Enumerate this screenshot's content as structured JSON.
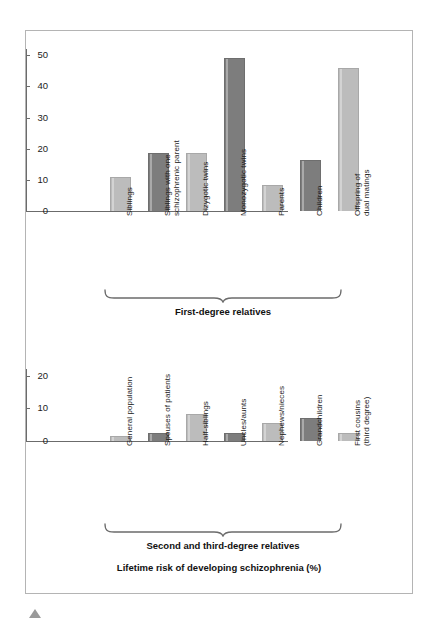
{
  "figure": {
    "caption": "Lifetime risk of developing schizophrenia (%)",
    "marker_icon": "triangle-up-icon"
  },
  "chart_data": [
    {
      "id": "first-degree",
      "type": "bar",
      "title": "",
      "group_label": "First-degree relatives",
      "xlabel": "",
      "ylabel": "",
      "ylim": [
        0,
        52
      ],
      "yticks": [
        0,
        10,
        20,
        30,
        40,
        50
      ],
      "ytick_labels": [
        "0",
        "10",
        "20",
        "30",
        "40",
        "50"
      ],
      "grid": false,
      "legend": "none",
      "categories": [
        "Siblings",
        "Siblings with one\nschizophrenic parent",
        "Dizygotic twins",
        "Monozygotic twins",
        "Parents",
        "Children",
        "Offspring of\ndual matings"
      ],
      "values": [
        11,
        18.5,
        18.7,
        49,
        8.4,
        16.5,
        46
      ],
      "bar_shades": [
        "light",
        "dark",
        "light",
        "dark",
        "light",
        "dark",
        "light"
      ]
    },
    {
      "id": "second-third-degree",
      "type": "bar",
      "title": "",
      "group_label": "Second and third-degree relatives",
      "xlabel": "",
      "ylabel": "",
      "ylim": [
        0,
        22
      ],
      "yticks": [
        0,
        10,
        20
      ],
      "ytick_labels": [
        "0",
        "10",
        "20"
      ],
      "grid": false,
      "legend": "none",
      "categories": [
        "General population",
        "Spouses of patients",
        "Half-siblings",
        "Uncles/aunts",
        "Nephews/nieces",
        "Grandchildren",
        "First cousins\n(third degree)"
      ],
      "values": [
        1.6,
        2.5,
        8.2,
        2.4,
        5.6,
        7.0,
        2.4
      ],
      "bar_shades": [
        "light",
        "dark",
        "light",
        "dark",
        "light",
        "dark",
        "light"
      ]
    }
  ],
  "colors": {
    "bar_light": "#bcbcbc",
    "bar_dark": "#7d7d7d",
    "axis": "#6b6b6b",
    "frame_border": "#b4b4b4",
    "text": "#111111"
  }
}
